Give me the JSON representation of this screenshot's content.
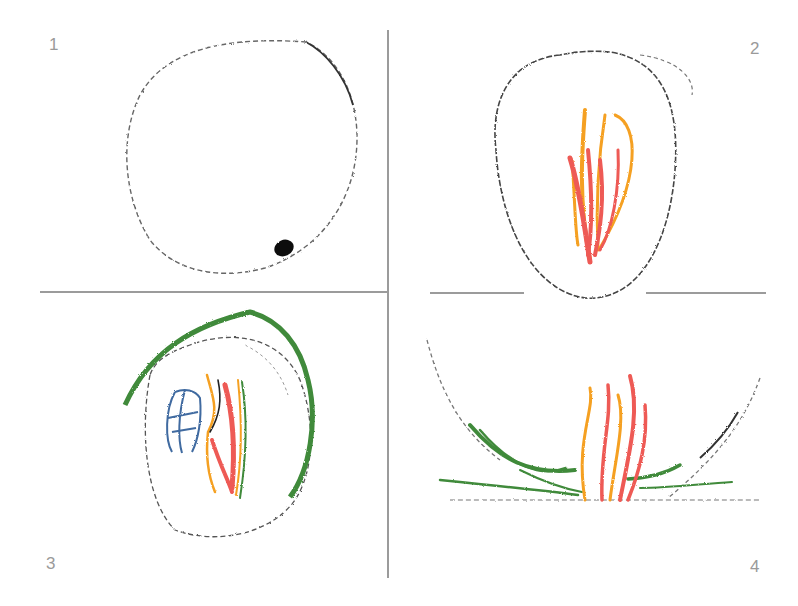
{
  "diagram": {
    "panels": [
      {
        "number": "1",
        "description": "empty circle with dark dot at lower right"
      },
      {
        "number": "2",
        "description": "circle containing red and orange flame-like strokes"
      },
      {
        "number": "3",
        "description": "circle with green outer arc, blue shape and red/orange strokes"
      },
      {
        "number": "4",
        "description": "open arc with green grass strokes and red/orange flames at base"
      }
    ],
    "colors": {
      "divider": "#9b9b9b",
      "outline": "#555555",
      "dot": "#111111",
      "red": "#ee5a55",
      "orange": "#f5a020",
      "green": "#3f8a3a",
      "blue": "#3f6aa0",
      "label": "#9a9a9a"
    }
  }
}
